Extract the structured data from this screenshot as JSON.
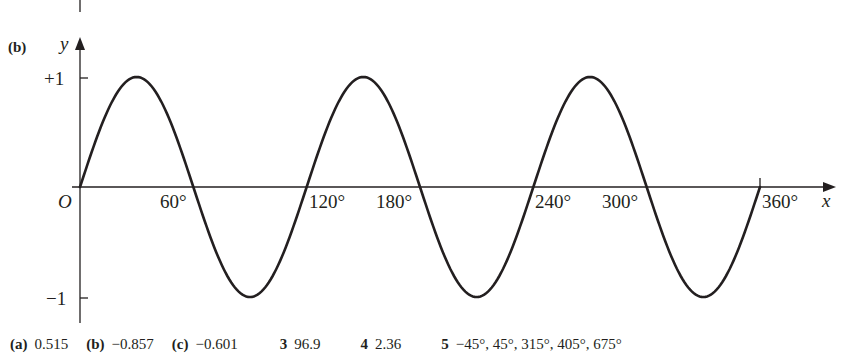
{
  "figure": {
    "part_label": "(b)",
    "x_axis_label": "x",
    "y_axis_label": "y",
    "origin_label": "O",
    "y_tick_labels": [
      "+1",
      "−1"
    ],
    "x_tick_labels": [
      "60°",
      "120°",
      "180°",
      "240°",
      "300°",
      "360°"
    ]
  },
  "chart_data": {
    "type": "line",
    "title": "",
    "function": "y = sin 3x",
    "xlabel": "x",
    "ylabel": "y",
    "x_unit": "degrees",
    "xlim": [
      0,
      360
    ],
    "ylim": [
      -1,
      1
    ],
    "x_ticks": [
      60,
      120,
      180,
      240,
      300,
      360
    ],
    "y_ticks": [
      -1,
      1
    ],
    "grid": false,
    "series": [
      {
        "name": "y = sin 3x",
        "x": [
          0,
          30,
          60,
          90,
          120,
          150,
          180,
          210,
          240,
          270,
          300,
          330,
          360
        ],
        "values": [
          0,
          1,
          0,
          -1,
          0,
          1,
          0,
          -1,
          0,
          1,
          0,
          -1,
          0
        ]
      }
    ],
    "annotations": [
      "O",
      "+1",
      "−1"
    ]
  },
  "answers": {
    "items": [
      {
        "num": "(a)",
        "value": "0.515"
      },
      {
        "num": "(b)",
        "value": "−0.857"
      },
      {
        "num": "(c)",
        "value": "−0.601"
      },
      {
        "num": "3",
        "value": "96.9"
      },
      {
        "num": "4",
        "value": "2.36"
      },
      {
        "num": "5",
        "value": "−45°, 45°, 315°, 405°, 675°"
      }
    ]
  }
}
